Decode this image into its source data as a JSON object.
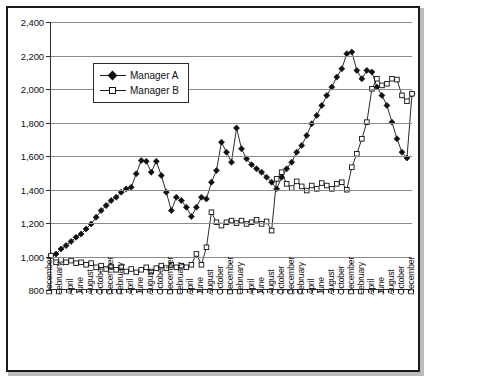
{
  "chart_data": {
    "type": "line",
    "title": "",
    "subtitle": "",
    "xlabel": "",
    "ylabel": "",
    "ylim": [
      800,
      2400
    ],
    "ytick_labels": [
      "800",
      "1,000",
      "1,200",
      "1,400",
      "1,600",
      "1,800",
      "2,000",
      "2,200",
      "2,400"
    ],
    "ytick_values": [
      800,
      1000,
      1200,
      1400,
      1600,
      1800,
      2000,
      2200,
      2400
    ],
    "grid": true,
    "legend_position": "inside-upper-left",
    "legend_entries": [
      "Manager A",
      "Manager B"
    ],
    "x_tick_labels_every": 2,
    "categories": [
      "December",
      "January",
      "February",
      "March",
      "April",
      "May",
      "June",
      "July",
      "August",
      "September",
      "October",
      "November",
      "December",
      "January",
      "February",
      "March",
      "April",
      "May",
      "June",
      "July",
      "August",
      "September",
      "October",
      "November",
      "December",
      "January",
      "February",
      "March",
      "April",
      "May",
      "June",
      "July",
      "August",
      "September",
      "October",
      "November",
      "December",
      "January",
      "February",
      "March",
      "April",
      "May",
      "June",
      "July",
      "August",
      "September",
      "October",
      "November",
      "December",
      "January",
      "February",
      "March",
      "April",
      "May",
      "June",
      "July",
      "August",
      "September",
      "October",
      "November",
      "December",
      "January",
      "February",
      "March",
      "April",
      "May",
      "June",
      "July",
      "August",
      "September",
      "October",
      "November",
      "December"
    ],
    "visible_x_labels": [
      "December",
      "February",
      "April",
      "June",
      "August",
      "October",
      "December",
      "February",
      "April",
      "June",
      "August",
      "October",
      "December",
      "February",
      "April",
      "June",
      "August",
      "October",
      "December",
      "February",
      "April",
      "June",
      "August",
      "October",
      "December",
      "February",
      "April",
      "June",
      "August",
      "October",
      "December",
      "February",
      "April",
      "June",
      "August",
      "October",
      "December"
    ],
    "series": [
      {
        "name": "Manager A",
        "marker": "filled-diamond",
        "color": "#111111",
        "values": [
          1000,
          1010,
          1040,
          1060,
          1085,
          1110,
          1130,
          1160,
          1190,
          1230,
          1270,
          1300,
          1330,
          1350,
          1380,
          1400,
          1410,
          1490,
          1570,
          1565,
          1500,
          1565,
          1480,
          1380,
          1270,
          1350,
          1330,
          1290,
          1235,
          1290,
          1350,
          1340,
          1440,
          1510,
          1680,
          1620,
          1560,
          1765,
          1640,
          1580,
          1545,
          1520,
          1500,
          1470,
          1440,
          1400,
          1470,
          1520,
          1560,
          1620,
          1660,
          1720,
          1790,
          1840,
          1900,
          1960,
          2010,
          2070,
          2120,
          2210,
          2220,
          2110,
          2060,
          2110,
          2100,
          2010,
          1960,
          1900,
          1800,
          1700,
          1620,
          1585,
          1970
        ]
      },
      {
        "name": "Manager B",
        "marker": "open-square",
        "color": "#111111",
        "values": [
          1000,
          960,
          975,
          960,
          970,
          955,
          960,
          945,
          955,
          930,
          940,
          920,
          935,
          915,
          930,
          905,
          920,
          900,
          915,
          930,
          905,
          925,
          940,
          925,
          945,
          930,
          940,
          930,
          945,
          1010,
          945,
          1050,
          1260,
          1200,
          1180,
          1200,
          1210,
          1195,
          1210,
          1190,
          1200,
          1215,
          1190,
          1205,
          1150,
          1460,
          1500,
          1430,
          1405,
          1445,
          1415,
          1390,
          1420,
          1400,
          1435,
          1420,
          1400,
          1430,
          1440,
          1395,
          1530,
          1610,
          1700,
          1800,
          2000,
          2060,
          2020,
          2030,
          2060,
          2055,
          1960,
          1925,
          1970
        ]
      }
    ]
  },
  "legend": {
    "manager_a": "Manager A",
    "manager_b": "Manager B"
  },
  "caption": ""
}
